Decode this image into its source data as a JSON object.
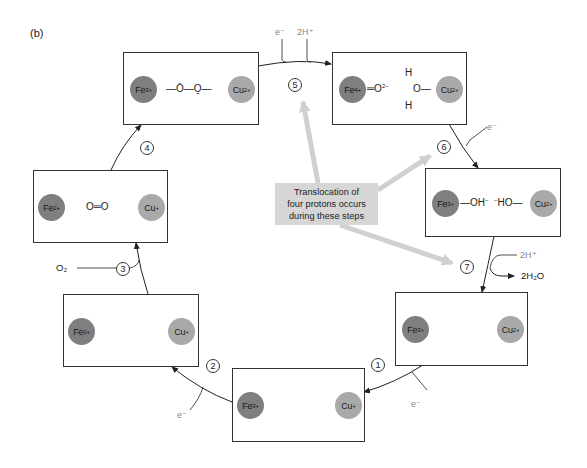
{
  "panel_label": "(b)",
  "callout": {
    "lines": [
      "Translocation of",
      "four protons occurs",
      "during these steps"
    ],
    "points_to_steps": [
      5,
      6,
      7
    ]
  },
  "steps": [
    {
      "number": "1",
      "input": "e⁻"
    },
    {
      "number": "2",
      "input": "e⁻"
    },
    {
      "number": "3",
      "input": "O₂"
    },
    {
      "number": "4"
    },
    {
      "number": "5",
      "inputs": [
        "e⁻",
        "2H⁺"
      ]
    },
    {
      "number": "6",
      "input": "e⁻"
    },
    {
      "number": "7",
      "input": "2H⁺",
      "output": "2H₂O"
    }
  ],
  "states": {
    "s1": {
      "fe": "Fe",
      "fe_charge": "3+",
      "cu": "Cu",
      "cu_charge": "+",
      "ligand": ""
    },
    "s2": {
      "fe": "Fe",
      "fe_charge": "2+",
      "cu": "Cu",
      "cu_charge": "+",
      "ligand": ""
    },
    "s3": {
      "fe": "Fe",
      "fe_charge": "2+",
      "cu": "Cu",
      "cu_charge": "+",
      "ligand": "O═O"
    },
    "s4": {
      "fe": "Fe",
      "fe_charge": "3+",
      "cu": "Cu",
      "cu_charge": "2+",
      "ligand": "—Ō—O̱—"
    },
    "s5": {
      "fe": "Fe",
      "fe_charge": "4+",
      "cu": "Cu",
      "cu_charge": "2+",
      "ligand_left": "═O",
      "ligand_left_charge": "2−",
      "water_o": "O—",
      "water_h": "H"
    },
    "s6": {
      "fe": "Fe",
      "fe_charge": "3+",
      "cu": "Cu",
      "cu_charge": "2+",
      "ligand_left": "—OH",
      "ligand_left_charge": "−",
      "ligand_right_charge": "−",
      "ligand_right": "HO—"
    },
    "s7": {
      "fe": "Fe",
      "fe_charge": "3+",
      "cu": "Cu",
      "cu_charge": "2+",
      "ligand": ""
    }
  },
  "colors": {
    "fe": "#7f7f7f",
    "cu": "#a9a9a9",
    "callout_bg": "#d6d6d6",
    "callout_arrow": "#d0d0d0",
    "input_gray": "#888888"
  }
}
